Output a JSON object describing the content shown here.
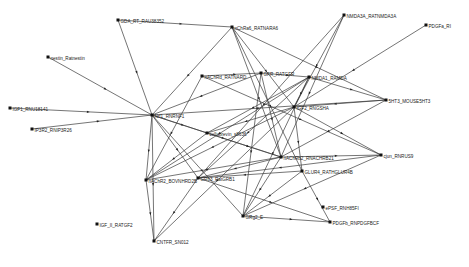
{
  "diagram": {
    "type": "directed-network",
    "colors": {
      "edge": "#3a3a3a",
      "node": "#111111",
      "label": "#222222",
      "background": "#ffffff"
    },
    "nodes": [
      {
        "id": "n0",
        "label": "GDA_RT_RAU38352",
        "x": 118,
        "y": 20
      },
      {
        "id": "n1",
        "label": "nChRa6_RATNARA6",
        "x": 232,
        "y": 27
      },
      {
        "id": "n2",
        "label": "NMDA3A_RATNMDA3A",
        "x": 344,
        "y": 15
      },
      {
        "id": "n3",
        "label": "PDGFa_RI",
        "x": 426,
        "y": 25
      },
      {
        "id": "n4",
        "label": "nestin_Ratnestin",
        "x": 48,
        "y": 57
      },
      {
        "id": "n5",
        "label": "nAChRd_RATNARD",
        "x": 202,
        "y": 76
      },
      {
        "id": "n6",
        "label": "GFR_RATGFR",
        "x": 261,
        "y": 73
      },
      {
        "id": "n7",
        "label": "NMDA1_RAMDA",
        "x": 309,
        "y": 77
      },
      {
        "id": "n8",
        "label": "5HT3_MOUSE5HT3",
        "x": 386,
        "y": 100
      },
      {
        "id": "n9",
        "label": "IGF2_RNGSHA",
        "x": 294,
        "y": 107
      },
      {
        "id": "n10",
        "label": "IGF1_RNU18141",
        "x": 10,
        "y": 108
      },
      {
        "id": "n11",
        "label": "Nrf1_RNRNF1",
        "x": 152,
        "y": 115
      },
      {
        "id": "n12",
        "label": "cellubrevin_s8636",
        "x": 207,
        "y": 133
      },
      {
        "id": "n13",
        "label": "IP3R2_RNIP3R26",
        "x": 32,
        "y": 129
      },
      {
        "id": "n14",
        "label": "nAChRb2_RNACHRB21",
        "x": 281,
        "y": 157
      },
      {
        "id": "n15",
        "label": "GLUR4_RATHGLUR4B",
        "x": 302,
        "y": 171
      },
      {
        "id": "n16",
        "label": "cjun_RNRUS9",
        "x": 381,
        "y": 155
      },
      {
        "id": "n17",
        "label": "nAChR2_BOVNHRD2B",
        "x": 146,
        "y": 180
      },
      {
        "id": "n18",
        "label": "GRb3_RatGRB1",
        "x": 198,
        "y": 178
      },
      {
        "id": "n19",
        "label": "ePSF_RNH85FI",
        "x": 323,
        "y": 207
      },
      {
        "id": "n20",
        "label": "GRg2_E",
        "x": 243,
        "y": 216
      },
      {
        "id": "n21",
        "label": "PDGFb_RNPDGFBCF",
        "x": 330,
        "y": 222
      },
      {
        "id": "n22",
        "label": "IGF_II_RATGF2",
        "x": 97,
        "y": 224
      },
      {
        "id": "n23",
        "label": "CNTFR_SN012",
        "x": 154,
        "y": 241
      }
    ],
    "edges": [
      [
        "n0",
        "n1"
      ],
      [
        "n0",
        "n11"
      ],
      [
        "n4",
        "n11"
      ],
      [
        "n10",
        "n11"
      ],
      [
        "n13",
        "n11"
      ],
      [
        "n1",
        "n9"
      ],
      [
        "n1",
        "n14"
      ],
      [
        "n1",
        "n8"
      ],
      [
        "n1",
        "n15"
      ],
      [
        "n1",
        "n11"
      ],
      [
        "n2",
        "n18"
      ],
      [
        "n2",
        "n9"
      ],
      [
        "n2",
        "n14"
      ],
      [
        "n3",
        "n9"
      ],
      [
        "n5",
        "n6"
      ],
      [
        "n5",
        "n17"
      ],
      [
        "n5",
        "n16"
      ],
      [
        "n6",
        "n7"
      ],
      [
        "n6",
        "n14"
      ],
      [
        "n6",
        "n20"
      ],
      [
        "n6",
        "n11"
      ],
      [
        "n7",
        "n17"
      ],
      [
        "n7",
        "n18"
      ],
      [
        "n7",
        "n8"
      ],
      [
        "n7",
        "n9"
      ],
      [
        "n7",
        "n12"
      ],
      [
        "n7",
        "n20"
      ],
      [
        "n8",
        "n11"
      ],
      [
        "n8",
        "n9"
      ],
      [
        "n8",
        "n14"
      ],
      [
        "n9",
        "n12"
      ],
      [
        "n9",
        "n15"
      ],
      [
        "n9",
        "n23"
      ],
      [
        "n9",
        "n16"
      ],
      [
        "n9",
        "n17"
      ],
      [
        "n11",
        "n12"
      ],
      [
        "n11",
        "n14"
      ],
      [
        "n11",
        "n18"
      ],
      [
        "n11",
        "n20"
      ],
      [
        "n11",
        "n23"
      ],
      [
        "n11",
        "n17"
      ],
      [
        "n12",
        "n14"
      ],
      [
        "n12",
        "n17"
      ],
      [
        "n14",
        "n16"
      ],
      [
        "n14",
        "n17"
      ],
      [
        "n14",
        "n18"
      ],
      [
        "n14",
        "n20"
      ],
      [
        "n15",
        "n21"
      ],
      [
        "n15",
        "n18"
      ],
      [
        "n15",
        "n20"
      ],
      [
        "n16",
        "n20"
      ],
      [
        "n16",
        "n18"
      ],
      [
        "n18",
        "n21"
      ],
      [
        "n18",
        "n23"
      ],
      [
        "n20",
        "n21"
      ],
      [
        "n17",
        "n23"
      ]
    ]
  }
}
